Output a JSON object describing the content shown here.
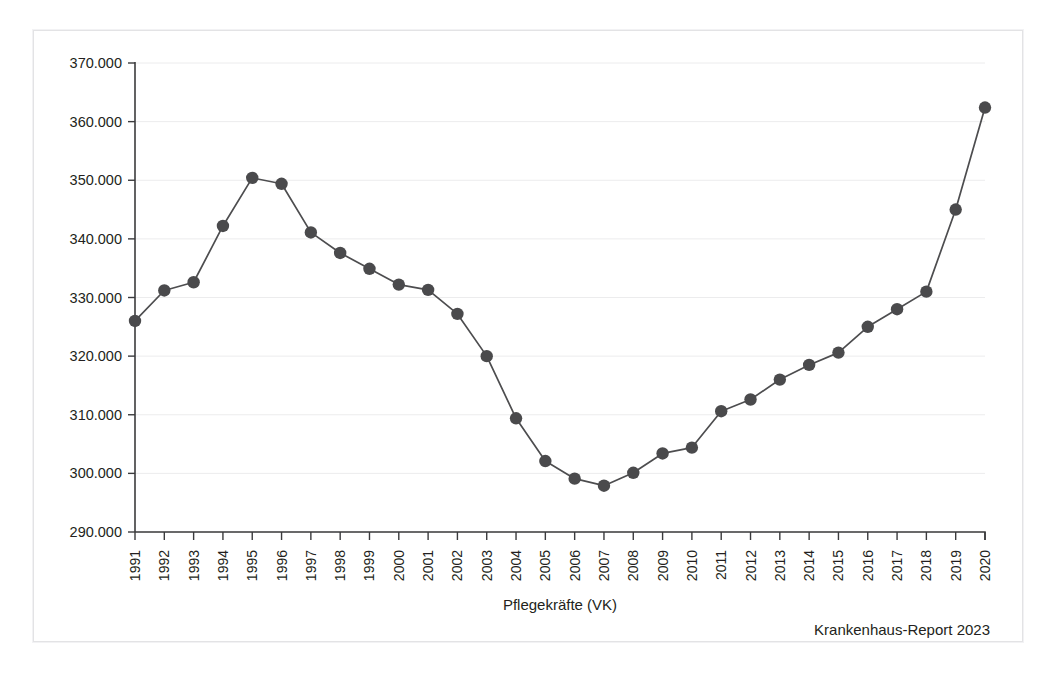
{
  "figure": {
    "source_note": "Krankenhaus-Report 2023"
  },
  "chart_data": {
    "type": "line",
    "title": "",
    "xlabel": "Pflegekräfte (VK)",
    "ylabel": "",
    "grid": true,
    "legend": "none",
    "xlim": [
      1991,
      2020
    ],
    "ylim": [
      290000,
      370000
    ],
    "ytick_labels": [
      "290.000",
      "300.000",
      "310.000",
      "320.000",
      "330.000",
      "340.000",
      "350.000",
      "360.000",
      "370.000"
    ],
    "yticks": [
      290000,
      300000,
      310000,
      320000,
      330000,
      340000,
      350000,
      360000,
      370000
    ],
    "categories": [
      "1991",
      "1992",
      "1993",
      "1994",
      "1995",
      "1996",
      "1997",
      "1998",
      "1999",
      "2000",
      "2001",
      "2002",
      "2003",
      "2004",
      "2005",
      "2006",
      "2007",
      "2008",
      "2009",
      "2010",
      "2011",
      "2012",
      "2013",
      "2014",
      "2015",
      "2016",
      "2017",
      "2018",
      "2019",
      "2020"
    ],
    "values": [
      326000,
      331200,
      332600,
      342200,
      350400,
      349400,
      341100,
      337600,
      334900,
      332200,
      331300,
      327200,
      320000,
      309400,
      302100,
      299100,
      297900,
      300100,
      303400,
      304400,
      310600,
      312600,
      316000,
      318500,
      320600,
      325000,
      328000,
      331000,
      345000,
      362400
    ],
    "series_name": "Pflegekräfte (VK)",
    "marker": "circle",
    "marker_color": "#4a4a4c",
    "line_color": "#4d4d4f"
  }
}
